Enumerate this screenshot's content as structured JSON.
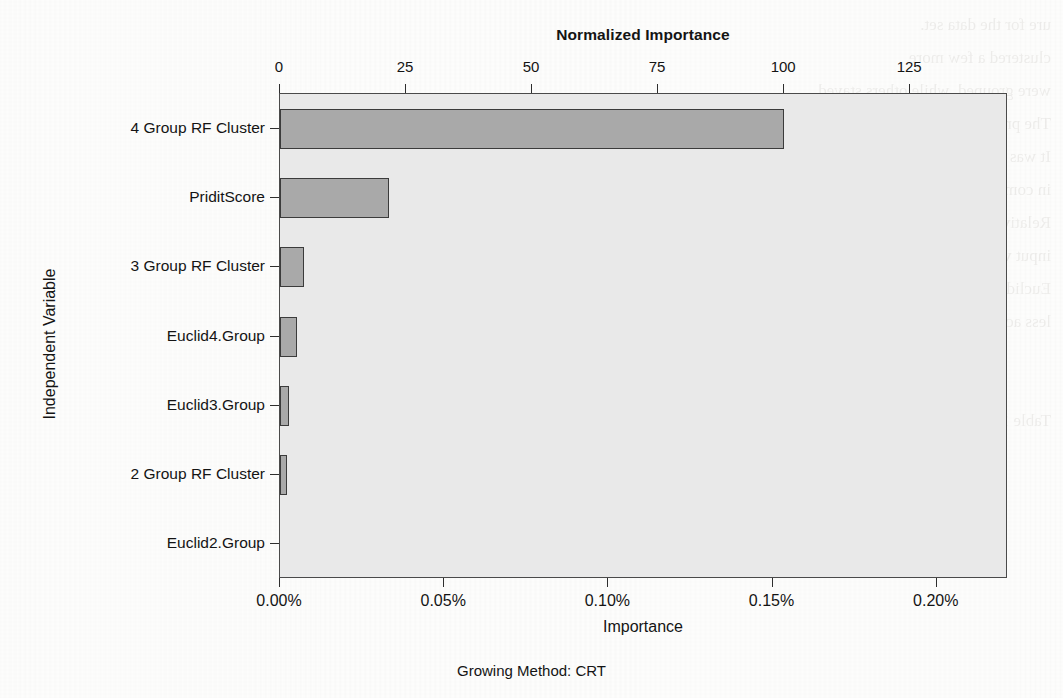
{
  "figure": {
    "top_title": "Normalized Importance",
    "y_axis_title": "Independent Variable",
    "x_axis_title": "Importance",
    "footer": "Growing Method: CRT",
    "bar_fill": "#a9a9a9",
    "bar_stroke": "#3b3b3b",
    "plot_bg": "#e9e9e9"
  },
  "bleed_text": "ure for the data set.\nclustered a few more\nwere grouped, while others stayed.\nThe previous analysis yielded 10 groupings.\nIt was noted that the final clusters\nin comparison with the random forest clustering.\nRelative importance was derived for each of the\ninput variables and compared across the methods.\nEuclidean distance measures resulted in slightly\nless accurate results.\n\n\nTable 10. Results of the normalized\n",
  "chart_data": {
    "type": "bar",
    "orientation": "horizontal",
    "title": "Normalized Importance",
    "xlabel": "Importance",
    "ylabel": "Independent Variable",
    "footer": "Growing Method: CRT",
    "categories": [
      "4 Group RF Cluster",
      "PriditScore",
      "3 Group RF Cluster",
      "Euclid4.Group",
      "Euclid3.Group",
      "2 Group RF Cluster",
      "Euclid2.Group"
    ],
    "values_normalized_importance": [
      100.0,
      21.6,
      4.8,
      3.4,
      1.8,
      1.3,
      0.0
    ],
    "values_importance_percent": [
      0.1535,
      0.0331,
      0.0074,
      0.0052,
      0.0028,
      0.002,
      0.0
    ],
    "top_axis": {
      "label": "Normalized Importance",
      "ticks": [
        0,
        25,
        50,
        75,
        100,
        125
      ],
      "ticklabels": [
        "0",
        "25",
        "50",
        "75",
        "100",
        "125"
      ],
      "range": [
        0,
        144.4
      ]
    },
    "bottom_axis": {
      "label": "Importance",
      "ticks": [
        0.0,
        0.05,
        0.1,
        0.15,
        0.2
      ],
      "ticklabels": [
        "0.00%",
        "0.05%",
        "0.10%",
        "0.15%",
        "0.20%"
      ],
      "range": [
        0.0,
        0.2217
      ]
    },
    "grid": false,
    "legend": null
  }
}
